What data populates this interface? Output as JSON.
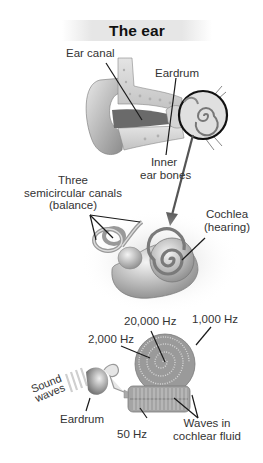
{
  "title": "The ear",
  "outer_ear_section": {
    "labels": {
      "ear_canal": "Ear canal",
      "eardrum": "Eardrum",
      "inner_ear_bones_line1": "Inner",
      "inner_ear_bones_line2": "ear bones"
    }
  },
  "inner_ear_section": {
    "labels": {
      "canals_line1": "Three",
      "canals_line2": "semicircular canals",
      "canals_line3": "(balance)",
      "cochlea_line1": "Cochlea",
      "cochlea_line2": "(hearing)"
    }
  },
  "cochlea_frequency_section": {
    "labels": {
      "f20000": "20,000 Hz",
      "f1000": "1,000 Hz",
      "f2000": "2,000 Hz",
      "f50": "50 Hz",
      "sound_waves_line1": "Sound",
      "sound_waves_line2": "waves",
      "eardrum": "Eardrum",
      "waves_line1": "Waves in",
      "waves_line2": "cochlear fluid"
    }
  },
  "colors": {
    "line": "#1a1a1a",
    "tissue_light": "#d9d9d9",
    "tissue_mid": "#a8a8a8",
    "tissue_dark": "#6e6e6e",
    "title_bg": "#e6e6e6"
  }
}
